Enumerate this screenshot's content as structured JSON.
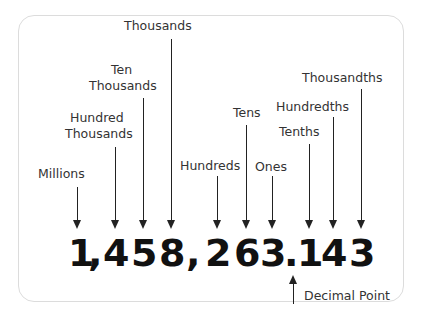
{
  "diagram": {
    "number": "1,458,263.143",
    "characters": [
      "1",
      ",",
      "4",
      "5",
      "8",
      ",",
      "2",
      "6",
      "3",
      ".",
      "1",
      "4",
      "3"
    ],
    "labels": {
      "millions": "Millions",
      "hundred_thousands_1": "Hundred",
      "hundred_thousands_2": "Thousands",
      "ten_thousands_1": "Ten",
      "ten_thousands_2": "Thousands",
      "thousands": "Thousands",
      "hundreds": "Hundreds",
      "tens": "Tens",
      "ones": "Ones",
      "tenths": "Tenths",
      "hundredths": "Hundredths",
      "thousandths": "Thousandths",
      "decimal_point": "Decimal Point"
    },
    "colors": {
      "text": "#333333",
      "digits": "#111111",
      "arrows": "#222222",
      "frame": "#dcdcdc"
    }
  }
}
